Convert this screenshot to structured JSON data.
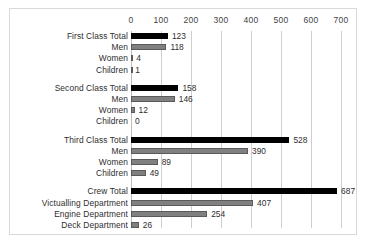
{
  "chart_data": {
    "type": "bar",
    "orientation": "horizontal",
    "title": "",
    "xlabel": "",
    "ylabel": "",
    "xlim": [
      0,
      700
    ],
    "grid": true,
    "legend": "none",
    "xticks": [
      0,
      100,
      200,
      300,
      400,
      500,
      600,
      700
    ],
    "xtick_labels": [
      "0",
      "100",
      "200",
      "300",
      "400",
      "500",
      "600",
      "700"
    ],
    "categories": [
      "First Class Total",
      "Men",
      "Women",
      "Children",
      "Second Class Total",
      "Men",
      "Women",
      "Children",
      "Third Class Total",
      "Men",
      "Women",
      "Children",
      "Crew Total",
      "Victualling Department",
      "Engine Department",
      "Deck Department"
    ],
    "values": [
      123,
      118,
      4,
      1,
      158,
      146,
      12,
      0,
      528,
      390,
      89,
      49,
      687,
      407,
      254,
      26
    ],
    "value_labels": [
      "123",
      "118",
      "4",
      "1",
      "158",
      "146",
      "12",
      "0",
      "528",
      "390",
      "89",
      "49",
      "687",
      "407",
      "254",
      "26"
    ],
    "groups": [
      {
        "name": "First Class",
        "rows": [
          {
            "label": "First Class Total",
            "value": 123,
            "value_label": "123",
            "style": "total"
          },
          {
            "label": "Men",
            "value": 118,
            "value_label": "118",
            "style": "sub"
          },
          {
            "label": "Women",
            "value": 4,
            "value_label": "4",
            "style": "sub"
          },
          {
            "label": "Children",
            "value": 1,
            "value_label": "1",
            "style": "sub"
          }
        ]
      },
      {
        "name": "Second Class",
        "rows": [
          {
            "label": "Second Class Total",
            "value": 158,
            "value_label": "158",
            "style": "total"
          },
          {
            "label": "Men",
            "value": 146,
            "value_label": "146",
            "style": "sub"
          },
          {
            "label": "Women",
            "value": 12,
            "value_label": "12",
            "style": "sub"
          },
          {
            "label": "Children",
            "value": 0,
            "value_label": "0",
            "style": "sub"
          }
        ]
      },
      {
        "name": "Third Class",
        "rows": [
          {
            "label": "Third Class Total",
            "value": 528,
            "value_label": "528",
            "style": "total"
          },
          {
            "label": "Men",
            "value": 390,
            "value_label": "390",
            "style": "sub"
          },
          {
            "label": "Women",
            "value": 89,
            "value_label": "89",
            "style": "sub"
          },
          {
            "label": "Children",
            "value": 49,
            "value_label": "49",
            "style": "sub"
          }
        ]
      },
      {
        "name": "Crew",
        "rows": [
          {
            "label": "Crew Total",
            "value": 687,
            "value_label": "687",
            "style": "total"
          },
          {
            "label": "Victualling Department",
            "value": 407,
            "value_label": "407",
            "style": "sub"
          },
          {
            "label": "Engine Department",
            "value": 254,
            "value_label": "254",
            "style": "sub"
          },
          {
            "label": "Deck Department",
            "value": 26,
            "value_label": "26",
            "style": "sub"
          }
        ]
      }
    ],
    "colors": {
      "total_bar": "#000000",
      "sub_bar": "#808080",
      "bar_outline": "#4a4a4a",
      "gridline": "#cfcfcf",
      "frame_border": "#d9d9d9",
      "text": "#2e2e2e",
      "background": "#ffffff"
    }
  }
}
